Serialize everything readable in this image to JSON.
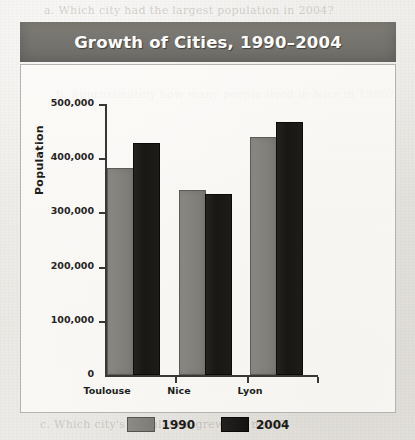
{
  "chart_data": {
    "type": "bar",
    "title": "Growth of Cities, 1990–2004",
    "xlabel": "",
    "ylabel": "Population",
    "categories": [
      "Toulouse",
      "Nice",
      "Lyon"
    ],
    "series": [
      {
        "name": "1990",
        "color": "#817f7a",
        "values": [
          378000,
          338000,
          435000
        ]
      },
      {
        "name": "2004",
        "color": "#17160f",
        "values": [
          424000,
          330000,
          463000
        ]
      }
    ],
    "ylim": [
      0,
      500000
    ],
    "ytick_values": [
      0,
      100000,
      200000,
      300000,
      400000,
      500000
    ],
    "ytick_labels": [
      "0",
      "100,000",
      "200,000",
      "300,000",
      "400,000",
      "500,000"
    ],
    "grid": false,
    "legend_position": "bottom"
  },
  "figure": {
    "title": "Growth of Cities, 1990–2004",
    "banner_color": "#777570",
    "frame_border_color": "#b6b3ae"
  },
  "axes": {
    "y_label": "Population",
    "y_ticks": [
      "500,000",
      "400,000",
      "300,000",
      "200,000",
      "100,000",
      "0"
    ],
    "x_categories": [
      "Toulouse",
      "Nice",
      "Lyon"
    ]
  },
  "legend": {
    "items": [
      {
        "label": "1990",
        "color": "#817f7a"
      },
      {
        "label": "2004",
        "color": "#17160f"
      }
    ]
  },
  "page": {
    "ghost_lines": [
      "a. Which city had the largest population in 2004?",
      "b. Approximately how many people lived in Nice in 1990?",
      "c. Which city's population grew the most?"
    ]
  }
}
